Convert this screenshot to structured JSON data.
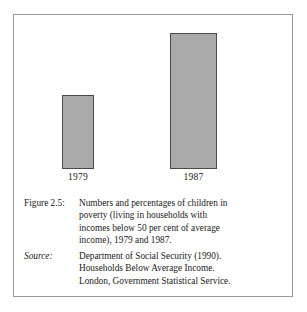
{
  "figure": {
    "border_color": "#9a9a9a",
    "background": "#ffffff"
  },
  "chart_data": {
    "type": "bar",
    "title": "",
    "xlabel": "",
    "ylabel": "",
    "categories": [
      "1979",
      "1987"
    ],
    "values": [
      12,
      26
    ],
    "value_labels": [
      "12%",
      "26%"
    ],
    "value_unit": "percent",
    "ylim": [
      0,
      30
    ],
    "grid": false,
    "legend": null,
    "bar_fill_color": "#aaaaaa",
    "bar_edge_color": "#4a4a4a"
  },
  "caption": {
    "tag": "Figure 2.5:",
    "lines": [
      "Numbers and percentages of children in",
      "poverty (living in households with",
      "incomes below 50 per cent of average",
      "income), 1979 and 1987."
    ]
  },
  "source": {
    "tag": "Source:",
    "lines": [
      "Department of Social Security (1990).",
      "Households Below Average Income.",
      "London, Government Statistical Service."
    ]
  }
}
